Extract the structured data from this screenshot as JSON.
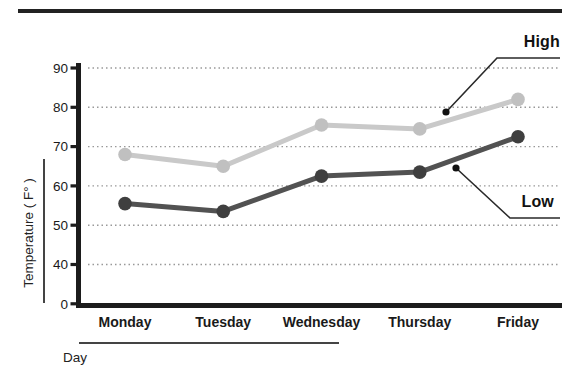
{
  "chart_data": {
    "type": "line",
    "categories": [
      "Monday",
      "Tuesday",
      "Wednesday",
      "Thursday",
      "Friday"
    ],
    "series": [
      {
        "name": "High",
        "values": [
          68,
          65,
          75.5,
          74.5,
          82
        ],
        "color": "#c9c9c9",
        "marker_color": "#c0c0c0"
      },
      {
        "name": "Low",
        "values": [
          55.5,
          53.5,
          62.5,
          63.5,
          72.5
        ],
        "color": "#525252",
        "marker_color": "#3f3f3f"
      }
    ],
    "y_ticks": [
      90,
      80,
      70,
      60,
      50,
      40,
      0
    ],
    "xlabel": "Day",
    "ylabel": "Temperature ( F° )",
    "title": "",
    "grid": "horizontal dotted lines at 40–90",
    "legend_position": "inline callout labels",
    "axis_note": "y axis broken: 0 tick then 40–90 at equal spacing"
  },
  "annotations": {
    "high": "High",
    "low": "Low"
  },
  "colors": {
    "background": "#ffffff",
    "axis": "#1c1c1c",
    "grid": "#999999",
    "text": "#1a1a1a",
    "callout": "#2a2a2a",
    "top_rule": "#222222"
  }
}
